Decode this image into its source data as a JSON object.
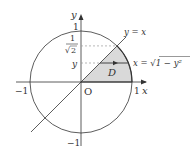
{
  "diagram": {
    "axes": {
      "x_label": "x",
      "y_label": "y",
      "origin_label": "O"
    },
    "ticks": {
      "x_neg": "−1",
      "x_pos": "1",
      "y_pos": "1",
      "y_neg": "−1"
    },
    "y_labels": {
      "frac_num": "1",
      "frac_den": "2",
      "sqrt_symbol": "√",
      "y_var": "y"
    },
    "curve_labels": {
      "line": "y = x",
      "arc": "x = √1 − y²"
    },
    "region_label": "D",
    "colors": {
      "stroke": "#333333",
      "region_fill": "#d9d9d9",
      "dashed": "#999999"
    }
  }
}
